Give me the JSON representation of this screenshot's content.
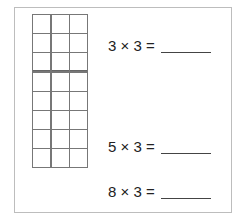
{
  "worksheet": {
    "grid": {
      "columns": 3,
      "rows": 8,
      "separator_after_row": 3
    },
    "problems": [
      {
        "expression": "3 × 3 =",
        "answer": ""
      },
      {
        "expression": "5 × 3 =",
        "answer": ""
      },
      {
        "expression": "8 × 3 =",
        "answer": ""
      }
    ]
  }
}
